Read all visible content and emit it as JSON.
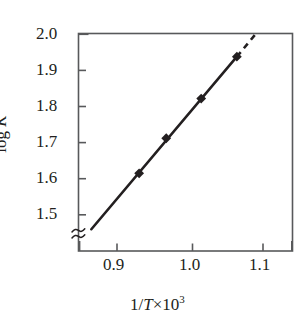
{
  "figure": {
    "background_color": "#ffffff",
    "line_color": "#231f20",
    "axis_color": "#58595b"
  },
  "axes": {
    "y_title_prefix": "log ",
    "y_title_symbol": "K",
    "x_title_prefix": "1/",
    "x_title_symbol": "T",
    "x_title_times": "×10",
    "x_title_exponent": "3",
    "y_ticks": [
      "2.0",
      "1.9",
      "1.8",
      "1.7",
      "1.6",
      "1.5"
    ],
    "x_ticks": [
      "0.9",
      "1.0",
      "1.1"
    ],
    "axis_break_symbol": "axis-break"
  },
  "chart_data": {
    "type": "scatter",
    "title": "",
    "xlabel": "1/T×10³",
    "ylabel": "log K",
    "xlim": [
      0.855,
      1.155
    ],
    "ylim": [
      1.44,
      2.0
    ],
    "xticks": [
      0.9,
      1.0,
      1.1
    ],
    "yticks": [
      1.5,
      1.6,
      1.7,
      1.8,
      1.9,
      2.0
    ],
    "grid": false,
    "legend": false,
    "y_axis_break": true,
    "y_axis_break_below": 1.5,
    "x": [
      0.94,
      0.978,
      1.027,
      1.077
    ],
    "y": [
      1.615,
      1.712,
      1.822,
      1.938
    ],
    "marker": "filled-diamond",
    "series": [
      {
        "name": "log K vs 1/T",
        "x": [
          0.94,
          0.978,
          1.027,
          1.077
        ],
        "y": [
          1.615,
          1.712,
          1.822,
          1.938
        ]
      }
    ],
    "fit_line": {
      "style": "solid",
      "x_start": 0.873,
      "y_start": 1.46,
      "x_end": 1.077,
      "y_end": 1.938
    },
    "extrapolation_line": {
      "style": "dashed",
      "x_start": 1.077,
      "y_start": 1.938,
      "x_end": 1.103,
      "y_end": 2.0
    }
  }
}
